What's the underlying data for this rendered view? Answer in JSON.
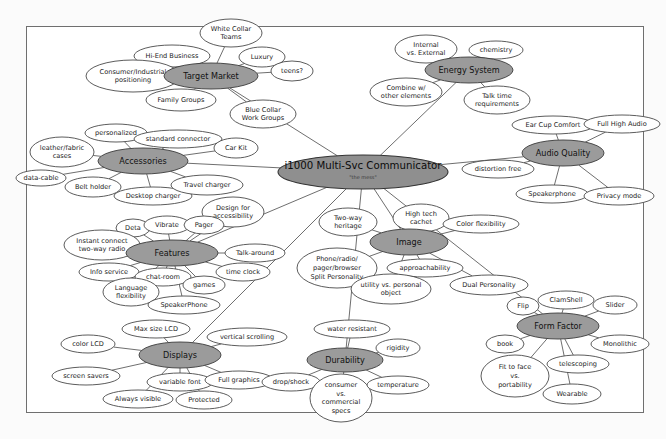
{
  "document": {
    "type": "mind-map",
    "title": "i1000 Multi-Svc Communicator",
    "subtitle": "\"the mess\"",
    "background_color": "#fbfbfb",
    "page_color": "#ffffff",
    "frame_color": "#6f6f6f",
    "branch_fill": "#9b9b9b",
    "root_fill": "#8f8f8f",
    "leaf_fill": "#ffffff",
    "line_color": "#5e5e5e"
  },
  "root": {
    "label": "i1000 Multi-Svc Communicator",
    "sub_label": "\"the mess\"",
    "cx": 363,
    "cy": 172,
    "rx": 85,
    "ry": 17
  },
  "branches": [
    {
      "id": "target-market",
      "label": "Target Market",
      "cx": 211,
      "cy": 76,
      "rx": 47,
      "ry": 13,
      "leaves": [
        {
          "label": "White Collar\nTeams",
          "cx": 231,
          "cy": 33,
          "rx": 31,
          "ry": 14
        },
        {
          "label": "Hi-End Business",
          "cx": 172,
          "cy": 56,
          "rx": 38,
          "ry": 11
        },
        {
          "label": "Luxury",
          "cx": 262,
          "cy": 57,
          "rx": 23,
          "ry": 10
        },
        {
          "label": "teens?",
          "cx": 292,
          "cy": 71,
          "rx": 21,
          "ry": 10
        },
        {
          "label": "Consumer/Industrial\npositioning",
          "cx": 133,
          "cy": 76,
          "rx": 47,
          "ry": 16
        },
        {
          "label": "Family Groups",
          "cx": 181,
          "cy": 100,
          "rx": 35,
          "ry": 11
        },
        {
          "label": "Blue Collar\nWork Groups",
          "cx": 263,
          "cy": 114,
          "rx": 33,
          "ry": 14
        }
      ]
    },
    {
      "id": "accessories",
      "label": "Accessories",
      "cx": 143,
      "cy": 161,
      "rx": 45,
      "ry": 13,
      "leaves": [
        {
          "label": "personalized",
          "cx": 116,
          "cy": 133,
          "rx": 31,
          "ry": 9
        },
        {
          "label": "standard connector",
          "cx": 178,
          "cy": 139,
          "rx": 44,
          "ry": 9
        },
        {
          "label": "Car Kit",
          "cx": 236,
          "cy": 148,
          "rx": 22,
          "ry": 10
        },
        {
          "label": "leather/fabric\ncases",
          "cx": 62,
          "cy": 152,
          "rx": 32,
          "ry": 15
        },
        {
          "label": "data-cable",
          "cx": 41,
          "cy": 178,
          "rx": 25,
          "ry": 8
        },
        {
          "label": "Belt holder",
          "cx": 93,
          "cy": 187,
          "rx": 28,
          "ry": 10
        },
        {
          "label": "Desktop charger",
          "cx": 153,
          "cy": 196,
          "rx": 39,
          "ry": 9
        },
        {
          "label": "Travel charger",
          "cx": 207,
          "cy": 185,
          "rx": 36,
          "ry": 10
        }
      ]
    },
    {
      "id": "features",
      "label": "Features",
      "cx": 172,
      "cy": 253,
      "rx": 46,
      "ry": 13,
      "leaves": [
        {
          "label": "Design for\naccessibility",
          "cx": 233,
          "cy": 212,
          "rx": 31,
          "ry": 15
        },
        {
          "label": "Deta",
          "cx": 133,
          "cy": 228,
          "rx": 17,
          "ry": 9
        },
        {
          "label": "Vibrate",
          "cx": 167,
          "cy": 225,
          "rx": 23,
          "ry": 9
        },
        {
          "label": "Pager",
          "cx": 204,
          "cy": 225,
          "rx": 20,
          "ry": 9
        },
        {
          "label": "Instant connect\ntwo-way radio",
          "cx": 102,
          "cy": 245,
          "rx": 38,
          "ry": 15
        },
        {
          "label": "Talk-around",
          "cx": 255,
          "cy": 253,
          "rx": 30,
          "ry": 9
        },
        {
          "label": "Info service",
          "cx": 109,
          "cy": 272,
          "rx": 30,
          "ry": 9
        },
        {
          "label": "chat-room",
          "cx": 163,
          "cy": 277,
          "rx": 28,
          "ry": 9
        },
        {
          "label": "time clock",
          "cx": 243,
          "cy": 272,
          "rx": 27,
          "ry": 9
        },
        {
          "label": "games",
          "cx": 204,
          "cy": 285,
          "rx": 21,
          "ry": 9
        },
        {
          "label": "Language\nflexibility",
          "cx": 131,
          "cy": 292,
          "rx": 28,
          "ry": 14
        },
        {
          "label": "SpeakerPhone",
          "cx": 184,
          "cy": 305,
          "rx": 36,
          "ry": 9
        }
      ]
    },
    {
      "id": "displays",
      "label": "Displays",
      "cx": 180,
      "cy": 355,
      "rx": 41,
      "ry": 13,
      "leaves": [
        {
          "label": "Max size LCD",
          "cx": 156,
          "cy": 329,
          "rx": 34,
          "ry": 9
        },
        {
          "label": "vertical scrolling",
          "cx": 247,
          "cy": 337,
          "rx": 40,
          "ry": 9
        },
        {
          "label": "color LCD",
          "cx": 88,
          "cy": 344,
          "rx": 27,
          "ry": 9
        },
        {
          "label": "screen savers",
          "cx": 86,
          "cy": 376,
          "rx": 34,
          "ry": 9
        },
        {
          "label": "variable font",
          "cx": 180,
          "cy": 382,
          "rx": 33,
          "ry": 9
        },
        {
          "label": "Full graphics",
          "cx": 239,
          "cy": 380,
          "rx": 34,
          "ry": 9
        },
        {
          "label": "Always visible",
          "cx": 138,
          "cy": 399,
          "rx": 35,
          "ry": 9
        },
        {
          "label": "Protected",
          "cx": 204,
          "cy": 400,
          "rx": 28,
          "ry": 9
        }
      ]
    },
    {
      "id": "durability",
      "label": "Durability",
      "cx": 345,
      "cy": 360,
      "rx": 38,
      "ry": 12,
      "leaves": [
        {
          "label": "water resistant",
          "cx": 352,
          "cy": 329,
          "rx": 38,
          "ry": 9
        },
        {
          "label": "rigidity",
          "cx": 398,
          "cy": 348,
          "rx": 22,
          "ry": 9
        },
        {
          "label": "drop/shock",
          "cx": 291,
          "cy": 382,
          "rx": 29,
          "ry": 9
        },
        {
          "label": "consumer\nvs.\ncommercial\nspecs",
          "cx": 341,
          "cy": 398,
          "rx": 31,
          "ry": 24
        },
        {
          "label": "temperature",
          "cx": 398,
          "cy": 385,
          "rx": 31,
          "ry": 9
        }
      ]
    },
    {
      "id": "image",
      "label": "Image",
      "cx": 409,
      "cy": 242,
      "rx": 39,
      "ry": 13,
      "leaves": [
        {
          "label": "Two-way\nheritage",
          "cx": 348,
          "cy": 222,
          "rx": 29,
          "ry": 14
        },
        {
          "label": "High tech\ncachet",
          "cx": 421,
          "cy": 218,
          "rx": 28,
          "ry": 14
        },
        {
          "label": "Color flexibility",
          "cx": 481,
          "cy": 224,
          "rx": 38,
          "ry": 9
        },
        {
          "label": "Phone/radio/\npager/browser\nSplit Personality",
          "cx": 337,
          "cy": 268,
          "rx": 40,
          "ry": 20
        },
        {
          "label": "approachability",
          "cx": 425,
          "cy": 268,
          "rx": 38,
          "ry": 9
        },
        {
          "label": "Dual Personality",
          "cx": 489,
          "cy": 285,
          "rx": 39,
          "ry": 10
        },
        {
          "label": "utility vs. personal\nobject",
          "cx": 391,
          "cy": 289,
          "rx": 40,
          "ry": 15
        }
      ]
    },
    {
      "id": "energy-system",
      "label": "Energy System",
      "cx": 469,
      "cy": 70,
      "rx": 44,
      "ry": 13,
      "leaves": [
        {
          "label": "Internal\nvs. External",
          "cx": 426,
          "cy": 49,
          "rx": 31,
          "ry": 14
        },
        {
          "label": "chemistry",
          "cx": 496,
          "cy": 50,
          "rx": 27,
          "ry": 9
        },
        {
          "label": "Combine w/\nother elements",
          "cx": 406,
          "cy": 92,
          "rx": 36,
          "ry": 14
        },
        {
          "label": "Talk time\nrequirements",
          "cx": 497,
          "cy": 100,
          "rx": 33,
          "ry": 14
        }
      ]
    },
    {
      "id": "audio-quality",
      "label": "Audio Quality",
      "cx": 563,
      "cy": 153,
      "rx": 41,
      "ry": 13,
      "leaves": [
        {
          "label": "Ear Cup Comfort",
          "cx": 553,
          "cy": 125,
          "rx": 41,
          "ry": 9
        },
        {
          "label": "Full High Audio",
          "cx": 622,
          "cy": 124,
          "rx": 38,
          "ry": 9
        },
        {
          "label": "distortion free",
          "cx": 498,
          "cy": 169,
          "rx": 36,
          "ry": 9
        },
        {
          "label": "Speakerphone",
          "cx": 552,
          "cy": 194,
          "rx": 36,
          "ry": 9
        },
        {
          "label": "Privacy mode",
          "cx": 619,
          "cy": 196,
          "rx": 35,
          "ry": 9
        }
      ]
    },
    {
      "id": "form-factor",
      "label": "Form Factor",
      "cx": 558,
      "cy": 326,
      "rx": 41,
      "ry": 13,
      "leaves": [
        {
          "label": "Flip",
          "cx": 523,
          "cy": 306,
          "rx": 16,
          "ry": 9
        },
        {
          "label": "ClamShell",
          "cx": 566,
          "cy": 300,
          "rx": 28,
          "ry": 9
        },
        {
          "label": "Slider",
          "cx": 615,
          "cy": 305,
          "rx": 22,
          "ry": 9
        },
        {
          "label": "book",
          "cx": 505,
          "cy": 344,
          "rx": 19,
          "ry": 9
        },
        {
          "label": "Monolithic",
          "cx": 620,
          "cy": 344,
          "rx": 29,
          "ry": 9
        },
        {
          "label": "telescoping",
          "cx": 578,
          "cy": 364,
          "rx": 31,
          "ry": 9
        },
        {
          "label": "Fit to face\nvs.\nportability",
          "cx": 515,
          "cy": 376,
          "rx": 34,
          "ry": 21
        },
        {
          "label": "Wearable",
          "cx": 572,
          "cy": 394,
          "rx": 29,
          "ry": 10
        }
      ]
    }
  ]
}
